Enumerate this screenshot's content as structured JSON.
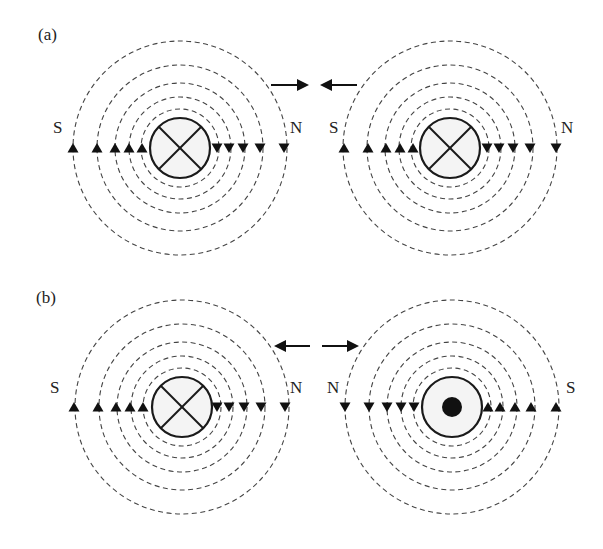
{
  "figure": {
    "panels": [
      {
        "id": "a",
        "label": "(a)",
        "caption_hint": "Two parallel conductors with currents in the same direction attract",
        "conductors": [
          {
            "current": "into-page",
            "symbol": "cross",
            "left_pole": "S",
            "right_pole": "N",
            "left_arrows": "up",
            "right_arrows": "down"
          },
          {
            "current": "into-page",
            "symbol": "cross",
            "left_pole": "S",
            "right_pole": "N",
            "left_arrows": "up",
            "right_arrows": "down"
          }
        ],
        "force": "attraction",
        "force_arrows": [
          "right",
          "left"
        ]
      },
      {
        "id": "b",
        "label": "(b)",
        "caption_hint": "Two parallel conductors with currents in opposite directions repel",
        "conductors": [
          {
            "current": "into-page",
            "symbol": "cross",
            "left_pole": "S",
            "right_pole": "N",
            "left_arrows": "up",
            "right_arrows": "down"
          },
          {
            "current": "out-of-page",
            "symbol": "dot",
            "left_pole": "N",
            "right_pole": "S",
            "left_arrows": "down",
            "right_arrows": "up"
          }
        ],
        "force": "repulsion",
        "force_arrows": [
          "left",
          "right"
        ]
      }
    ],
    "field_line_count": 5,
    "labels": {
      "a": "(a)",
      "b": "(b)",
      "a_left_S": "S",
      "a_left_N": "N",
      "a_right_S": "S",
      "a_right_N": "N",
      "b_left_S": "S",
      "b_left_N": "N",
      "b_right_N": "N",
      "b_right_S": "S"
    },
    "colors": {
      "line": "#444444",
      "conductor_fill": "#f4f4f4",
      "ink": "#111111"
    }
  }
}
